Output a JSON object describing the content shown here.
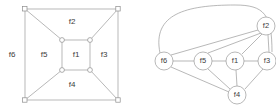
{
  "figure": {
    "colors": {
      "edge": "#9a9a9a",
      "vertex_stroke": "#8d8d8d",
      "vertex_fill": "#ffffff",
      "label_text": "#3c3c3c",
      "background": "#ffffff"
    }
  },
  "planar": {
    "name": "planar-embedding",
    "outer_square": {
      "x1": 25,
      "y1": 9,
      "x2": 118,
      "y2": 100
    },
    "inner_square": {
      "x1": 62,
      "y1": 40,
      "x2": 90,
      "y2": 70
    },
    "vertices": [
      {
        "id": "outer-top-left",
        "x": 25,
        "y": 9
      },
      {
        "id": "outer-top-right",
        "x": 118,
        "y": 9
      },
      {
        "id": "outer-bottom-right",
        "x": 118,
        "y": 100
      },
      {
        "id": "outer-bottom-left",
        "x": 25,
        "y": 100
      },
      {
        "id": "inner-top-left",
        "x": 62,
        "y": 40
      },
      {
        "id": "inner-top-right",
        "x": 90,
        "y": 40
      },
      {
        "id": "inner-bottom-right",
        "x": 90,
        "y": 70
      },
      {
        "id": "inner-bottom-left",
        "x": 62,
        "y": 70
      }
    ],
    "diagonals": [
      {
        "from": "outer-top-left",
        "to": "inner-top-left"
      },
      {
        "from": "outer-top-right",
        "to": "inner-top-right"
      },
      {
        "from": "outer-bottom-right",
        "to": "inner-bottom-right"
      },
      {
        "from": "outer-bottom-left",
        "to": "inner-bottom-left"
      }
    ],
    "face_labels": [
      {
        "id": "f1",
        "text": "f1",
        "x": 76,
        "y": 55
      },
      {
        "id": "f2",
        "text": "f2",
        "x": 72,
        "y": 22
      },
      {
        "id": "f3",
        "text": "f3",
        "x": 104,
        "y": 55
      },
      {
        "id": "f4",
        "text": "f4",
        "x": 72,
        "y": 85
      },
      {
        "id": "f5",
        "text": "f5",
        "x": 44,
        "y": 55
      },
      {
        "id": "f6",
        "text": "f6",
        "x": 12,
        "y": 55
      }
    ]
  },
  "dual": {
    "name": "dual-graph",
    "nodes": [
      {
        "id": "f2",
        "text": "f2",
        "x": 128,
        "y": 26,
        "r": 9
      },
      {
        "id": "f6",
        "text": "f6",
        "x": 26,
        "y": 61,
        "r": 9
      },
      {
        "id": "f5",
        "text": "f5",
        "x": 65,
        "y": 61,
        "r": 9
      },
      {
        "id": "f1",
        "text": "f1",
        "x": 97,
        "y": 61,
        "r": 9
      },
      {
        "id": "f3",
        "text": "f3",
        "x": 129,
        "y": 61,
        "r": 9
      },
      {
        "id": "f4",
        "text": "f4",
        "x": 99,
        "y": 95,
        "r": 9
      }
    ],
    "edges": [
      {
        "from": "f6",
        "to": "f5"
      },
      {
        "from": "f5",
        "to": "f1"
      },
      {
        "from": "f1",
        "to": "f3"
      },
      {
        "from": "f6",
        "to": "f2"
      },
      {
        "from": "f5",
        "to": "f2"
      },
      {
        "from": "f1",
        "to": "f2"
      },
      {
        "from": "f3",
        "to": "f2"
      },
      {
        "from": "f6",
        "to": "f4"
      },
      {
        "from": "f5",
        "to": "f4"
      },
      {
        "from": "f1",
        "to": "f4"
      },
      {
        "from": "f3",
        "to": "f4"
      }
    ],
    "curved_edges": [
      {
        "from": "f6",
        "to": "f3",
        "label": "outer-face-arc"
      }
    ]
  }
}
